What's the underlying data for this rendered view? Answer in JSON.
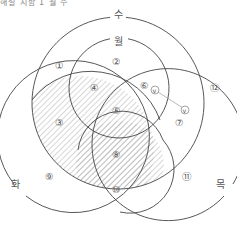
{
  "header": {
    "cut_text": "해설 지함 1 월 수"
  },
  "sets": [
    {
      "key": "wed",
      "label": "수"
    },
    {
      "key": "mon",
      "label": "월"
    },
    {
      "key": "tue",
      "label": "화"
    },
    {
      "key": "thu",
      "label": "목"
    }
  ],
  "regions": [
    {
      "id": 1,
      "label": "①"
    },
    {
      "id": 2,
      "label": "②"
    },
    {
      "id": 3,
      "label": "③"
    },
    {
      "id": 4,
      "label": "④"
    },
    {
      "id": 5,
      "label": "⑤"
    },
    {
      "id": 6,
      "label": "⑥"
    },
    {
      "id": 7,
      "label": "⑦"
    },
    {
      "id": 8,
      "label": "⑧"
    },
    {
      "id": 9,
      "label": "⑨"
    },
    {
      "id": 10,
      "label": "⑩"
    },
    {
      "id": 11,
      "label": "⑪"
    },
    {
      "id": 12,
      "label": "⑫"
    }
  ],
  "markers": [
    {
      "label": "v"
    },
    {
      "label": "v"
    }
  ],
  "shaded_regions": [
    "③",
    "④",
    "⑤",
    "⑧"
  ],
  "colors": {
    "stroke": "#444444",
    "hatch": "#9a9a9a",
    "text": "#555555"
  }
}
